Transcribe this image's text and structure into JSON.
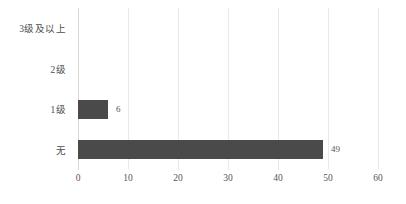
{
  "chart_data": {
    "type": "bar",
    "orientation": "horizontal",
    "title": "",
    "subtitle": "",
    "xlabel": "",
    "ylabel": "",
    "categories": [
      "3级及以上",
      "2级",
      "1级",
      "无"
    ],
    "values": [
      0,
      0,
      6,
      49
    ],
    "data_labels": [
      "",
      "",
      "6",
      "49"
    ],
    "xlim": [
      0,
      60
    ],
    "xticks": [
      0,
      10,
      20,
      30,
      40,
      50,
      60
    ],
    "xtick_labels": [
      "0",
      "10",
      "20",
      "30",
      "40",
      "50",
      "60"
    ],
    "grid": true,
    "grid_axis": "x",
    "legend": false,
    "legend_position": "none",
    "series": [
      {
        "name": "",
        "values": [
          0,
          0,
          6,
          49
        ]
      }
    ]
  },
  "style": {
    "bar_color": "#4a4a4a",
    "gridline_color": "#e9e9e9",
    "axis_color": "#d8d8d8",
    "text_color": "#4d4d4d",
    "background": "#ffffff"
  }
}
